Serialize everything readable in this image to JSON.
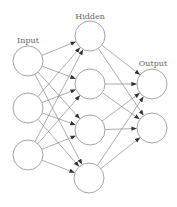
{
  "diagram": {
    "layers": [
      {
        "label": "Input",
        "label_pos": [
          28,
          43
        ],
        "nodes": [
          [
            28,
            61
          ],
          [
            28,
            108
          ],
          [
            28,
            155
          ]
        ]
      },
      {
        "label": "Hidden",
        "label_pos": [
          90,
          19
        ],
        "nodes": [
          [
            90,
            36
          ],
          [
            90,
            84
          ],
          [
            90,
            130
          ],
          [
            89,
            178
          ]
        ]
      },
      {
        "label": "Output",
        "label_pos": [
          153,
          66
        ],
        "nodes": [
          [
            152,
            84
          ],
          [
            152,
            128
          ]
        ]
      }
    ],
    "node_radius": 15,
    "connections": "fully-connected between adjacent layers, arrows pointing right",
    "colors": {
      "node_stroke": "#9a9a9a",
      "edge": "#6a6a6a",
      "label": "#666666",
      "background": "#ffffff"
    }
  }
}
